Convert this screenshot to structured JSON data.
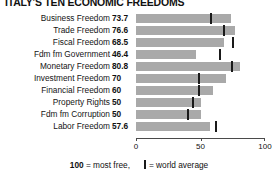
{
  "chart_data": {
    "type": "bar",
    "title": "ITALY'S TEN ECONOMIC FREEDOMS",
    "orientation": "horizontal",
    "xlabel": "",
    "ylabel": "",
    "xlim": [
      0,
      100
    ],
    "ticks": [
      0,
      50,
      100
    ],
    "tick_labels": [
      "0",
      "50",
      "100"
    ],
    "grid": false,
    "legend_position": "bottom",
    "categories": [
      "Business Freedom",
      "Trade Freedom",
      "Fiscal Freedom",
      "Fdm fm Government",
      "Monetary Freedom",
      "Investment Freedom",
      "Financial Freedom",
      "Property Rights",
      "Fdm fm Corruption",
      "Labor Freedom"
    ],
    "values": [
      73.7,
      76.6,
      68.5,
      46.4,
      80.8,
      70,
      60,
      50,
      50,
      57.6
    ],
    "value_labels": [
      "73.7",
      "76.6",
      "68.5",
      "46.4",
      "80.8",
      "70",
      "60",
      "50",
      "50",
      "57.6"
    ],
    "series": [
      {
        "name": "Italy score",
        "values": [
          73.7,
          76.6,
          68.5,
          46.4,
          80.8,
          70,
          60,
          50,
          50,
          57.6
        ]
      },
      {
        "name": "world average",
        "values": [
          58.0,
          68.4,
          74.9,
          65.0,
          74.2,
          49.0,
          49.0,
          44.0,
          40.5,
          62.1
        ]
      }
    ],
    "bar_color": "#a9a9a9",
    "marker_color": "#1a1a1a",
    "annotations": {
      "legend_scale_bold": "100",
      "legend_scale_text": " = most free,",
      "legend_marker_text": "= world average"
    }
  }
}
